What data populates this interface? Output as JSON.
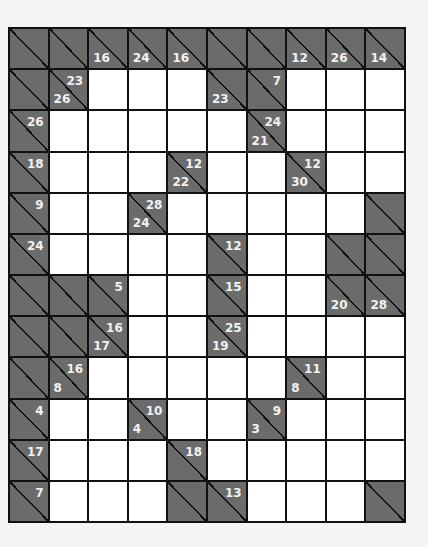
{
  "puzzle": {
    "type": "kakuro",
    "rows": 12,
    "cols": 10,
    "colors": {
      "clue_bg": "#6b6b6b",
      "cell_bg": "#ffffff",
      "grid_line": "#111111",
      "clue_text": "#f2f2f2"
    },
    "grid": [
      [
        {
          "t": "c"
        },
        {
          "t": "c"
        },
        {
          "t": "c",
          "d": "16"
        },
        {
          "t": "c",
          "d": "24"
        },
        {
          "t": "c",
          "d": "16"
        },
        {
          "t": "c"
        },
        {
          "t": "c"
        },
        {
          "t": "c",
          "d": "12"
        },
        {
          "t": "c",
          "d": "26"
        },
        {
          "t": "c",
          "d": "14"
        }
      ],
      [
        {
          "t": "c"
        },
        {
          "t": "c",
          "a": "23",
          "d": "26"
        },
        {
          "t": "w"
        },
        {
          "t": "w"
        },
        {
          "t": "w"
        },
        {
          "t": "c",
          "d": "23"
        },
        {
          "t": "c",
          "a": "7"
        },
        {
          "t": "w"
        },
        {
          "t": "w"
        },
        {
          "t": "w"
        }
      ],
      [
        {
          "t": "c",
          "a": "26"
        },
        {
          "t": "w"
        },
        {
          "t": "w"
        },
        {
          "t": "w"
        },
        {
          "t": "w"
        },
        {
          "t": "w"
        },
        {
          "t": "c",
          "a": "24",
          "d": "21"
        },
        {
          "t": "w"
        },
        {
          "t": "w"
        },
        {
          "t": "w"
        }
      ],
      [
        {
          "t": "c",
          "a": "18"
        },
        {
          "t": "w"
        },
        {
          "t": "w"
        },
        {
          "t": "w"
        },
        {
          "t": "c",
          "a": "12",
          "d": "22"
        },
        {
          "t": "w"
        },
        {
          "t": "w"
        },
        {
          "t": "c",
          "a": "12",
          "d": "30"
        },
        {
          "t": "w"
        },
        {
          "t": "w"
        }
      ],
      [
        {
          "t": "c",
          "a": "9"
        },
        {
          "t": "w"
        },
        {
          "t": "w"
        },
        {
          "t": "c",
          "a": "28",
          "d": "24"
        },
        {
          "t": "w"
        },
        {
          "t": "w"
        },
        {
          "t": "w"
        },
        {
          "t": "w"
        },
        {
          "t": "w"
        },
        {
          "t": "c"
        }
      ],
      [
        {
          "t": "c",
          "a": "24"
        },
        {
          "t": "w"
        },
        {
          "t": "w"
        },
        {
          "t": "w"
        },
        {
          "t": "w"
        },
        {
          "t": "c",
          "a": "12"
        },
        {
          "t": "w"
        },
        {
          "t": "w"
        },
        {
          "t": "c"
        },
        {
          "t": "c"
        }
      ],
      [
        {
          "t": "c"
        },
        {
          "t": "c"
        },
        {
          "t": "c",
          "a": "5"
        },
        {
          "t": "w"
        },
        {
          "t": "w"
        },
        {
          "t": "c",
          "a": "15"
        },
        {
          "t": "w"
        },
        {
          "t": "w"
        },
        {
          "t": "c",
          "d": "20"
        },
        {
          "t": "c",
          "d": "28"
        }
      ],
      [
        {
          "t": "c"
        },
        {
          "t": "c"
        },
        {
          "t": "c",
          "a": "16",
          "d": "17"
        },
        {
          "t": "w"
        },
        {
          "t": "w"
        },
        {
          "t": "c",
          "a": "25",
          "d": "19"
        },
        {
          "t": "w"
        },
        {
          "t": "w"
        },
        {
          "t": "w"
        },
        {
          "t": "w"
        }
      ],
      [
        {
          "t": "c"
        },
        {
          "t": "c",
          "a": "16",
          "d": "8"
        },
        {
          "t": "w"
        },
        {
          "t": "w"
        },
        {
          "t": "w"
        },
        {
          "t": "w"
        },
        {
          "t": "w"
        },
        {
          "t": "c",
          "a": "11",
          "d": "8"
        },
        {
          "t": "w"
        },
        {
          "t": "w"
        }
      ],
      [
        {
          "t": "c",
          "a": "4"
        },
        {
          "t": "w"
        },
        {
          "t": "w"
        },
        {
          "t": "c",
          "a": "10",
          "d": "4"
        },
        {
          "t": "w"
        },
        {
          "t": "w"
        },
        {
          "t": "c",
          "a": "9",
          "d": "3"
        },
        {
          "t": "w"
        },
        {
          "t": "w"
        },
        {
          "t": "w"
        }
      ],
      [
        {
          "t": "c",
          "a": "17"
        },
        {
          "t": "w"
        },
        {
          "t": "w"
        },
        {
          "t": "w"
        },
        {
          "t": "c",
          "a": "18"
        },
        {
          "t": "w"
        },
        {
          "t": "w"
        },
        {
          "t": "w"
        },
        {
          "t": "w"
        },
        {
          "t": "w"
        }
      ],
      [
        {
          "t": "c",
          "a": "7"
        },
        {
          "t": "w"
        },
        {
          "t": "w"
        },
        {
          "t": "w"
        },
        {
          "t": "c"
        },
        {
          "t": "c",
          "a": "13"
        },
        {
          "t": "w"
        },
        {
          "t": "w"
        },
        {
          "t": "w"
        },
        {
          "t": "c"
        }
      ]
    ]
  }
}
